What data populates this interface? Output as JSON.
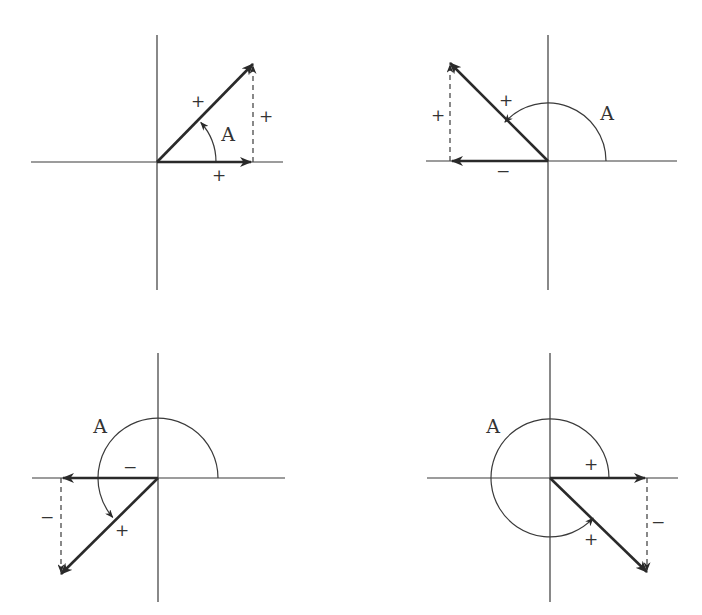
{
  "figure": {
    "colors": {
      "ink": "#2a2a2a",
      "axis": "#3a3a3a",
      "background": "#ffffff"
    },
    "panels": [
      {
        "id": "quadrant-1",
        "origin": [
          157,
          162
        ],
        "h_axis": [
          31,
          283
        ],
        "v_axis": [
          35,
          290
        ],
        "tip": [
          253,
          64
        ],
        "radius": 59,
        "arc": {
          "start_deg": 0,
          "end_deg": 42,
          "sweep": "ccw",
          "arrow_at_end": true
        },
        "labels": {
          "angle": {
            "text": "A",
            "pos": [
              228,
              141
            ]
          },
          "hypotenuse": {
            "text": "+",
            "pos": [
              198,
              107
            ]
          },
          "horizontal": {
            "text": "+",
            "pos": [
              219,
              181
            ]
          },
          "vertical": {
            "text": "+",
            "pos": [
              266,
              122
            ]
          }
        }
      },
      {
        "id": "quadrant-2",
        "origin": [
          548,
          161
        ],
        "h_axis": [
          426,
          677
        ],
        "v_axis": [
          35,
          290
        ],
        "tip": [
          450,
          63
        ],
        "radius": 58,
        "arc": {
          "start_deg": 0,
          "end_deg": 138,
          "sweep": "ccw",
          "arrow_at_end": true
        },
        "labels": {
          "angle": {
            "text": "A",
            "pos": [
              607,
              120
            ]
          },
          "hypotenuse": {
            "text": "+",
            "pos": [
              506,
              106
            ]
          },
          "horizontal": {
            "text": "−",
            "pos": [
              503,
              177
            ]
          },
          "vertical": {
            "text": "+",
            "pos": [
              438,
              121
            ]
          }
        }
      },
      {
        "id": "quadrant-3",
        "origin": [
          158,
          478
        ],
        "h_axis": [
          32,
          285
        ],
        "v_axis": [
          353,
          602
        ],
        "tip": [
          61,
          574
        ],
        "radius": 60,
        "arc": {
          "start_deg": 0,
          "end_deg": 221,
          "sweep": "ccw",
          "arrow_at_end": true
        },
        "labels": {
          "angle": {
            "text": "A",
            "pos": [
              100,
              433
            ]
          },
          "hypotenuse": {
            "text": "+",
            "pos": [
              122,
              536
            ]
          },
          "horizontal": {
            "text": "−",
            "pos": [
              130,
              473
            ]
          },
          "vertical": {
            "text": "−",
            "pos": [
              47,
              523
            ]
          }
        }
      },
      {
        "id": "quadrant-4",
        "origin": [
          550,
          478
        ],
        "h_axis": [
          427,
          678
        ],
        "v_axis": [
          353,
          602
        ],
        "tip": [
          647,
          572
        ],
        "radius": 59,
        "arc": {
          "start_deg": 0,
          "end_deg": 317,
          "sweep": "ccw",
          "arrow_at_end": true
        },
        "labels": {
          "angle": {
            "text": "A",
            "pos": [
              493,
              433
            ]
          },
          "hypotenuse": {
            "text": "+",
            "pos": [
              591,
              545
            ]
          },
          "horizontal": {
            "text": "+",
            "pos": [
              591,
              470
            ]
          },
          "vertical": {
            "text": "−",
            "pos": [
              658,
              528
            ]
          }
        }
      }
    ]
  }
}
